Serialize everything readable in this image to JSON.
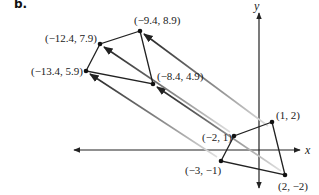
{
  "figure": {
    "part_label": "b.",
    "axes": {
      "x_label": "x",
      "y_label": "y",
      "origin_px": [
        259,
        150
      ],
      "unit_px": 13.2
    },
    "preimage": {
      "name": "original quadrilateral",
      "vertices": [
        {
          "label": "(1, 2)",
          "x": 1,
          "y": 2
        },
        {
          "label": "(2, −2)",
          "x": 2,
          "y": -2
        },
        {
          "label": "(−3, −1)",
          "x": -3,
          "y": -1
        },
        {
          "label": "(−2, 1)",
          "x": -2,
          "y": 1
        }
      ]
    },
    "image": {
      "name": "translated quadrilateral",
      "vertices": [
        {
          "label": "(−9.4, 8.9)",
          "x": -9.4,
          "y": 8.9
        },
        {
          "label": "(−8.4, 4.9)",
          "x": -8.4,
          "y": 4.9
        },
        {
          "label": "(−13.4, 5.9)",
          "x": -13.4,
          "y": 5.9
        },
        {
          "label": "(−12.4, 7.9)",
          "x": -12.4,
          "y": 7.9
        }
      ]
    },
    "translation_vector": {
      "dx": -10.4,
      "dy": 6.9
    },
    "colors": {
      "line": "#222222",
      "arrow_fade": "#bdbdbd",
      "point": "#111111"
    }
  }
}
